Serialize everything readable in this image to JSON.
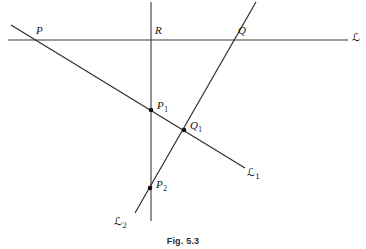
{
  "figure": {
    "caption": "Fig. 5.3",
    "background_color": "#ffffff",
    "stroke_color": "#303030"
  },
  "labels": {
    "P": "P",
    "R": "R",
    "Q": "Q",
    "P1_base": "P",
    "P1_sub": "1",
    "Q1_base": "Q",
    "Q1_sub": "1",
    "P2_base": "P",
    "P2_sub": "2",
    "L": "ℒ",
    "L1_base": "ℒ",
    "L1_sub": "1",
    "L2_base": "ℒ",
    "L2_sub": "2"
  },
  "geometry": {
    "lines": [
      {
        "name": "line-L-horizontal",
        "label": "ℒ",
        "x1": 8,
        "y1": 40,
        "x2": 348,
        "y2": 40
      },
      {
        "name": "line-vertical-transversal",
        "label": "",
        "x1": 151,
        "y1": 2,
        "x2": 151,
        "y2": 221
      },
      {
        "name": "line-L1-descending",
        "label": "ℒ1",
        "x1": 11,
        "y1": 25,
        "x2": 245,
        "y2": 168
      },
      {
        "name": "line-L2-ascending",
        "label": "ℒ2",
        "x1": 256,
        "y1": 2,
        "x2": 135,
        "y2": 213
      }
    ],
    "points": [
      {
        "name": "point-P",
        "label": "P",
        "x": 40,
        "y": 40,
        "dot": false
      },
      {
        "name": "point-R",
        "label": "R",
        "x": 151,
        "y": 40,
        "dot": false
      },
      {
        "name": "point-Q",
        "label": "Q",
        "x": 232,
        "y": 40,
        "dot": false
      },
      {
        "name": "point-P1",
        "label": "P1",
        "x": 151,
        "y": 110,
        "dot": true
      },
      {
        "name": "point-Q1",
        "label": "Q1",
        "x": 184,
        "y": 130,
        "dot": true
      },
      {
        "name": "point-P2",
        "label": "P2",
        "x": 150,
        "y": 188,
        "dot": true
      }
    ]
  }
}
